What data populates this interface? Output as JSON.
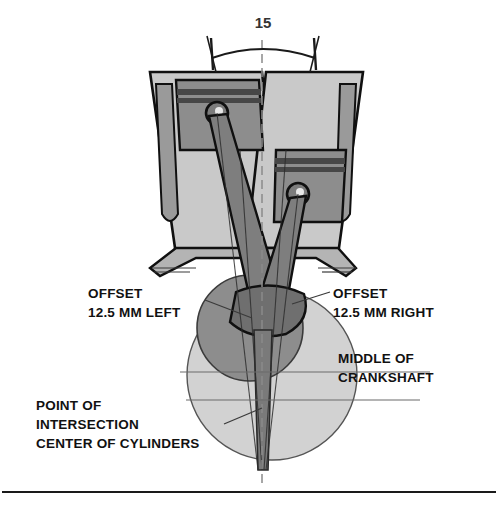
{
  "diagram": {
    "title_visible": false,
    "angle": {
      "value": "15",
      "name": "included-cylinder-angle",
      "arc_left_x": 211,
      "arc_right_x": 316,
      "arc_y": 46
    },
    "annotations": [
      {
        "id": "offset-left",
        "lines": [
          "OFFSET",
          "12.5 MM  LEFT"
        ],
        "x": 88,
        "y": 298,
        "align": "start"
      },
      {
        "id": "offset-right",
        "lines": [
          "OFFSET",
          "12.5 MM  RIGHT"
        ],
        "x": 333,
        "y": 298,
        "align": "start"
      },
      {
        "id": "middle-of-crankshaft",
        "lines": [
          "MIDDLE OF",
          "CRANKSHAFT"
        ],
        "x": 338,
        "y": 363,
        "align": "start"
      },
      {
        "id": "point-of-intersection",
        "lines": [
          "POINT OF",
          "INTERSECTION",
          "CENTER OF CYLINDERS"
        ],
        "x": 36,
        "y": 410,
        "align": "start"
      }
    ],
    "colors": {
      "outline": "#101010",
      "light_gray": "#d2d2d2",
      "mid_gray": "#b4b4b4",
      "dark_gray": "#8d8d8d",
      "darker_gray": "#6f6f6f",
      "band_gray": "#555555",
      "rule": "#1a1a1a",
      "thin_line": "#6b6b6b",
      "background": "#ffffff"
    },
    "crankshaft": {
      "swing_circle": {
        "cx": 272,
        "cy": 375,
        "r": 85,
        "fill": "#d2d2d2"
      },
      "throw_circle": {
        "cx": 250,
        "cy": 328,
        "r": 53,
        "fill": "#8d8d8d"
      },
      "reference_lines_y": [
        372,
        400
      ]
    },
    "footer_rule": {
      "y": 492,
      "x1": 2,
      "x2": 496
    }
  }
}
